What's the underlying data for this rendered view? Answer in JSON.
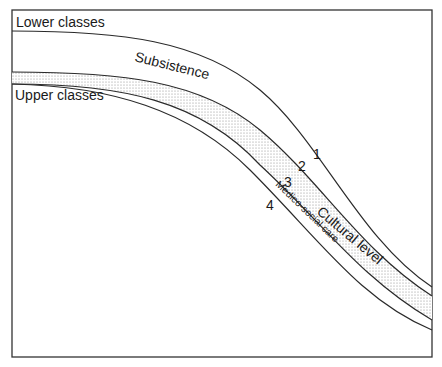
{
  "diagram": {
    "labels": {
      "lower_classes": "Lower classes",
      "upper_classes": "Upper classes",
      "subsistence": "Subsistence",
      "cultural_level": "Cultural level",
      "medico_social_care": "Medico-social care"
    },
    "curve_numbers": [
      "1",
      "2",
      "3",
      "4"
    ],
    "colors": {
      "line": "#2a2a2a",
      "frame": "#333333",
      "stipple": "#8a8a8a",
      "background": "#ffffff"
    }
  }
}
